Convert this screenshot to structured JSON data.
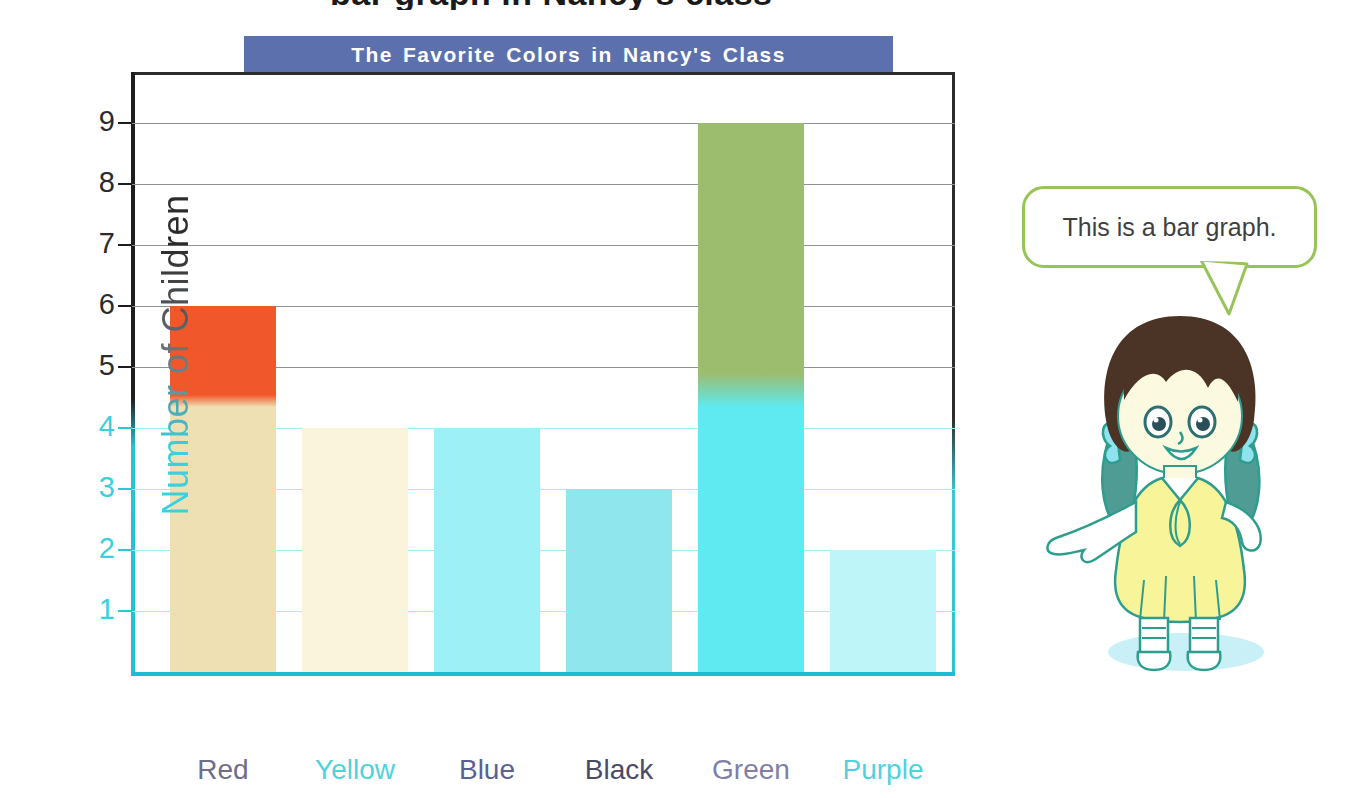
{
  "page": {
    "cropped_heading": "bar graph in Nancy's class",
    "background_color": "#ffffff"
  },
  "chart_data": {
    "type": "bar",
    "title": "The Favorite Colors in Nancy's Class",
    "xlabel": "Color",
    "ylabel": "Number of Children",
    "categories": [
      "Red",
      "Yellow",
      "Blue",
      "Black",
      "Green",
      "Purple"
    ],
    "values": [
      6,
      4,
      4,
      3,
      9,
      2
    ],
    "ylim": [
      0,
      9
    ],
    "ytick_labels": [
      "1",
      "2",
      "3",
      "4",
      "5",
      "6",
      "7",
      "8",
      "9"
    ],
    "grid": true,
    "legend": "none",
    "bar_colors": [
      "#f0572b",
      "#faf3d8",
      "#45e8ee",
      "#2fa8b0",
      "#9cbc6e",
      "#a8f2f6"
    ]
  },
  "title_banner": {
    "label": "The Favorite Colors in Nancy's Class",
    "background_color": "#5b70ad",
    "text_color": "#ffffff"
  },
  "axes": {
    "y_title": "Number of Children",
    "x_title": "Color",
    "y_ticks": [
      {
        "value": "9",
        "tone": "dark"
      },
      {
        "value": "8",
        "tone": "dark"
      },
      {
        "value": "7",
        "tone": "dark"
      },
      {
        "value": "6",
        "tone": "dark"
      },
      {
        "value": "5",
        "tone": "dark"
      },
      {
        "value": "4",
        "tone": "cyan"
      },
      {
        "value": "3",
        "tone": "cyan"
      },
      {
        "value": "2",
        "tone": "cyan"
      },
      {
        "value": "1",
        "tone": "cyan"
      }
    ]
  },
  "bars": [
    {
      "label": "Red",
      "value": 6,
      "label_color": "#6e6e8c"
    },
    {
      "label": "Yellow",
      "value": 4,
      "label_color": "#4fd2dd"
    },
    {
      "label": "Blue",
      "value": 4,
      "label_color": "#5a5f94"
    },
    {
      "label": "Black",
      "value": 3,
      "label_color": "#4a4a6a"
    },
    {
      "label": "Green",
      "value": 9,
      "label_color": "#7d7fa8"
    },
    {
      "label": "Purple",
      "value": 2,
      "label_color": "#4fd2dd"
    }
  ],
  "callout": {
    "text": "This is a bar graph.",
    "border_color": "#97c456"
  },
  "character": {
    "name": "Nancy",
    "hair_color": "#4b3326",
    "pigtail_color": "#4e9c93",
    "bow_color": "#8fe3ef",
    "dress_color": "#f7f49a",
    "outline_color": "#2e9d8e",
    "shadow_color": "#c9f0f7"
  }
}
